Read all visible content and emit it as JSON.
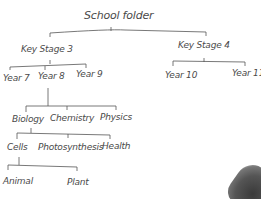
{
  "diagram": {
    "type": "tree",
    "root": "School folder",
    "nodes": {
      "root": "School folder",
      "ks3": "Key Stage 3",
      "ks4": "Key Stage 4",
      "y7": "Year 7",
      "y8": "Year 8",
      "y9": "Year 9",
      "y10": "Year 10",
      "y11": "Year 11",
      "biology": "Biology",
      "chemistry": "Chemistry",
      "physics": "Physics",
      "cells": "Cells",
      "photosynthesis": "Photosynthesis",
      "health": "Health",
      "animal": "Animal",
      "plant": "Plant"
    },
    "edges": [
      [
        "School folder",
        "Key Stage 3"
      ],
      [
        "School folder",
        "Key Stage 4"
      ],
      [
        "Key Stage 3",
        "Year 7"
      ],
      [
        "Key Stage 3",
        "Year 8"
      ],
      [
        "Key Stage 3",
        "Year 9"
      ],
      [
        "Key Stage 4",
        "Year 10"
      ],
      [
        "Key Stage 4",
        "Year 11"
      ],
      [
        "Year 8",
        "Biology"
      ],
      [
        "Year 8",
        "Chemistry"
      ],
      [
        "Year 8",
        "Physics"
      ],
      [
        "Biology",
        "Cells"
      ],
      [
        "Biology",
        "Photosynthesis"
      ],
      [
        "Biology",
        "Health"
      ],
      [
        "Cells",
        "Animal"
      ],
      [
        "Cells",
        "Plant"
      ]
    ]
  }
}
